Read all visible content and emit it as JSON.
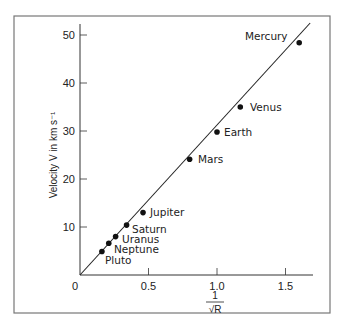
{
  "chart_data": {
    "type": "scatter",
    "title": "",
    "xlabel": "1/√R",
    "xlabel_numerator": "1",
    "xlabel_denominator": "√R",
    "ylabel": "Velocity V in km s⁻¹",
    "xlim": [
      0,
      1.7
    ],
    "ylim": [
      0,
      52
    ],
    "x_ticks": [
      0,
      0.5,
      1.0,
      1.5
    ],
    "x_tick_labels": [
      "0",
      "0.5",
      "1.0",
      "1.5"
    ],
    "y_ticks": [
      10,
      20,
      30,
      40,
      50
    ],
    "y_tick_labels": [
      "10",
      "20",
      "30",
      "40",
      "50"
    ],
    "grid": false,
    "legend": null,
    "fit_line": {
      "x": [
        0,
        1.68
      ],
      "y": [
        0,
        52.5
      ]
    },
    "points": [
      {
        "name": "Mercury",
        "x": 1.6,
        "y": 48.4
      },
      {
        "name": "Venus",
        "x": 1.17,
        "y": 35.0
      },
      {
        "name": "Earth",
        "x": 1.0,
        "y": 29.8
      },
      {
        "name": "Mars",
        "x": 0.8,
        "y": 24.1
      },
      {
        "name": "Jupiter",
        "x": 0.46,
        "y": 13.0
      },
      {
        "name": "Saturn",
        "x": 0.34,
        "y": 10.4
      },
      {
        "name": "Uranus",
        "x": 0.26,
        "y": 8.0
      },
      {
        "name": "Neptune",
        "x": 0.21,
        "y": 6.6
      },
      {
        "name": "Pluto",
        "x": 0.16,
        "y": 4.9
      }
    ]
  },
  "labels": {
    "mercury": "Mercury",
    "venus": "Venus",
    "earth": "Earth",
    "mars": "Mars",
    "jupiter": "Jupiter",
    "saturn": "Saturn",
    "uranus": "Uranus",
    "neptune": "Neptune",
    "pluto": "Pluto",
    "origin": "0"
  }
}
